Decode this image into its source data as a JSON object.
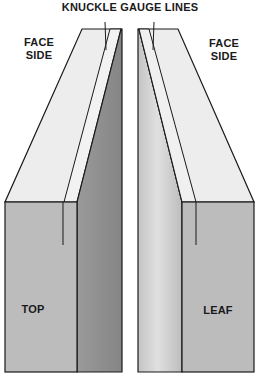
{
  "title": "KNUCKLE GAUGE LINES",
  "labels": {
    "left_face": "FACE\nSIDE",
    "left_face_l1": "FACE",
    "left_face_l2": "SIDE",
    "right_face_l1": "FACE",
    "right_face_l2": "SIDE",
    "left_piece": "TOP",
    "right_piece": "LEAF"
  },
  "colors": {
    "face_light": "#ededed",
    "front_gray": "#b9b9b9",
    "side_dark": "#8e8e8e",
    "side_light": "#cfcfcf",
    "outline": "#1a1a1a"
  }
}
